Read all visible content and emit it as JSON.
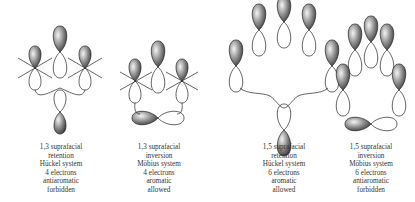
{
  "panels": [
    {
      "lines": [
        "1,3 suprafacial",
        "retention",
        "Hückel system",
        "4 electrons",
        "antiaromatic",
        "forbidden"
      ]
    },
    {
      "lines": [
        "1,3 suprafacial",
        "inversion",
        "Möbius system",
        "4 electrons",
        "aromatic",
        "allowed"
      ]
    },
    {
      "lines": [
        "1,5 suprafacial",
        "retention",
        "Hückel system",
        "6 electrons",
        "aromatic",
        "allowed"
      ]
    },
    {
      "lines": [
        "1,5 suprafacial",
        "inversion",
        "Möbius system",
        "6 electrons",
        "antiaromatic",
        "forbidden"
      ]
    }
  ],
  "colors": {
    "lobe_shaded": "#6a6a6a",
    "lobe_outline": "#222222",
    "background": "#ffffff"
  }
}
